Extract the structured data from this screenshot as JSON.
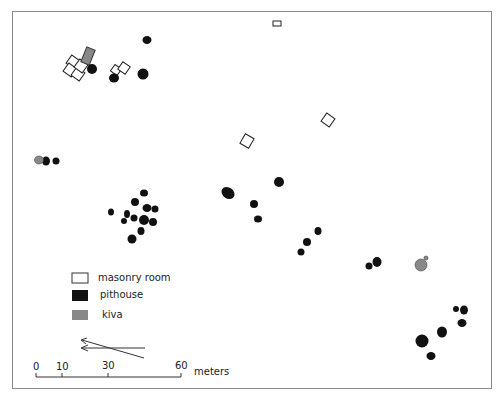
{
  "figure": {
    "type": "site map",
    "colors": {
      "masonry_room": "#ffffff",
      "pithouse": "#111111",
      "kiva": "#8a8a8a",
      "outline": "#333333",
      "frame": "#888888"
    }
  },
  "legend": {
    "items": [
      {
        "key": "masonry_room",
        "label": "masonry room"
      },
      {
        "key": "pithouse",
        "label": "pithouse"
      },
      {
        "key": "kiva",
        "label": "kiva"
      }
    ]
  },
  "scale_bar": {
    "ticks": [
      "0",
      "10",
      "30",
      "60"
    ],
    "unit": "meters"
  },
  "north_arrow": {
    "description": "two arrows pointing left (true and magnetic north)"
  }
}
